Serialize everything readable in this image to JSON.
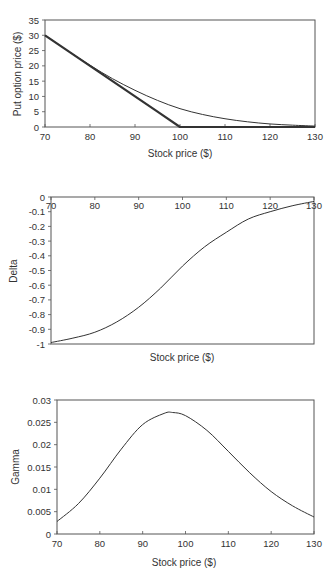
{
  "chart_data": [
    {
      "type": "line",
      "title": "",
      "xlabel": "Stock price ($)",
      "ylabel": "Put option price ($)",
      "xlim": [
        70,
        130
      ],
      "ylim": [
        0,
        35
      ],
      "xticks": [
        70,
        80,
        90,
        100,
        110,
        120,
        130
      ],
      "yticks": [
        0,
        5,
        10,
        15,
        20,
        25,
        30,
        35
      ],
      "grid": false,
      "legend": null,
      "x": [
        70,
        75,
        80,
        85,
        90,
        95,
        100,
        105,
        110,
        115,
        120,
        125,
        130
      ],
      "series": [
        {
          "name": "Option value",
          "values": [
            30.0,
            25.0,
            20.2,
            15.8,
            12.0,
            8.7,
            6.0,
            4.1,
            2.7,
            1.7,
            1.0,
            0.6,
            0.3
          ],
          "stroke_width": 1
        },
        {
          "name": "Intrinsic value",
          "values": [
            30,
            25,
            20,
            15,
            10,
            5,
            0,
            0,
            0,
            0,
            0,
            0,
            0
          ],
          "stroke_width": 2.2
        }
      ]
    },
    {
      "type": "line",
      "title": "",
      "xlabel": "Stock price ($)",
      "ylabel": "Delta",
      "xlim": [
        70,
        130
      ],
      "ylim": [
        -1,
        0
      ],
      "xticks": [
        70,
        80,
        90,
        100,
        110,
        120,
        130
      ],
      "yticks": [
        0,
        -0.1,
        -0.2,
        -0.3,
        -0.4,
        -0.5,
        -0.6,
        -0.7,
        -0.8,
        -0.9,
        -1
      ],
      "xaxis_position": "top",
      "grid": false,
      "legend": null,
      "x": [
        70,
        75,
        80,
        85,
        90,
        95,
        100,
        105,
        110,
        115,
        120,
        125,
        130
      ],
      "series": [
        {
          "name": "Delta",
          "values": [
            -0.99,
            -0.96,
            -0.92,
            -0.85,
            -0.75,
            -0.62,
            -0.47,
            -0.34,
            -0.24,
            -0.15,
            -0.1,
            -0.06,
            -0.03
          ],
          "stroke_width": 1
        }
      ]
    },
    {
      "type": "line",
      "title": "",
      "xlabel": "Stock price ($)",
      "ylabel": "Gamma",
      "xlim": [
        70,
        130
      ],
      "ylim": [
        0,
        0.03
      ],
      "xticks": [
        70,
        80,
        90,
        100,
        110,
        120,
        130
      ],
      "yticks": [
        0,
        0.005,
        0.01,
        0.015,
        0.02,
        0.025,
        0.03
      ],
      "grid": false,
      "legend": null,
      "x": [
        70,
        75,
        80,
        85,
        90,
        95,
        97,
        100,
        105,
        110,
        115,
        120,
        125,
        130
      ],
      "series": [
        {
          "name": "Gamma",
          "values": [
            0.0028,
            0.0068,
            0.0125,
            0.019,
            0.0245,
            0.027,
            0.0272,
            0.0265,
            0.0232,
            0.0185,
            0.0137,
            0.0095,
            0.0063,
            0.0038
          ],
          "stroke_width": 1
        }
      ]
    }
  ],
  "charts": [
    {
      "xlabel": "Stock price ($)",
      "ylabel": "Put option price ($)"
    },
    {
      "xlabel": "Stock price ($)",
      "ylabel": "Delta"
    },
    {
      "xlabel": "Stock price ($)",
      "ylabel": "Gamma"
    }
  ],
  "colors": {
    "line": "#333333",
    "axis": "#555555",
    "background": "#ffffff"
  }
}
